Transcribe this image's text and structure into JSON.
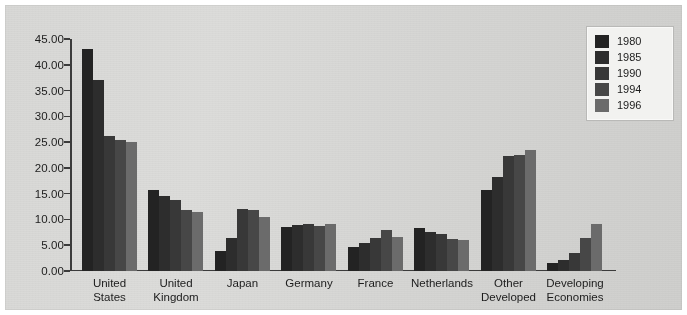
{
  "chart_data": {
    "type": "bar",
    "title": "",
    "subtitle": "",
    "xlabel": "",
    "ylabel": "",
    "ylim": [
      0,
      45
    ],
    "ytick_step": 5,
    "ytick_labels": [
      "0.00",
      "5.00",
      "10.00",
      "15.00",
      "20.00",
      "25.00",
      "30.00",
      "35.00",
      "40.00",
      "45.00"
    ],
    "grid": false,
    "legend_position": "top-right",
    "categories": [
      "United\nStates",
      "United\nKingdom",
      "Japan",
      "Germany",
      "France",
      "Netherlands",
      "Other\nDeveloped",
      "Developing\nEconomies"
    ],
    "series": [
      {
        "name": "1980",
        "color": "#232323",
        "values": [
          43.0,
          15.7,
          3.9,
          8.5,
          4.6,
          8.3,
          15.7,
          1.5
        ]
      },
      {
        "name": "1985",
        "color": "#2d2d2d",
        "values": [
          37.0,
          14.6,
          6.5,
          9.0,
          5.5,
          7.6,
          18.3,
          2.2
        ]
      },
      {
        "name": "1990",
        "color": "#383838",
        "values": [
          26.1,
          13.7,
          12.0,
          9.1,
          6.5,
          7.1,
          22.3,
          3.4
        ]
      },
      {
        "name": "1994",
        "color": "#474747",
        "values": [
          25.5,
          11.8,
          11.8,
          8.7,
          8.0,
          6.3,
          22.5,
          6.5
        ]
      },
      {
        "name": "1996",
        "color": "#6b6b6b",
        "values": [
          25.0,
          11.4,
          10.5,
          9.2,
          6.6,
          6.0,
          23.5,
          9.2
        ]
      }
    ]
  },
  "legend": {
    "items": [
      {
        "label": "1980",
        "color": "#232323"
      },
      {
        "label": "1985",
        "color": "#2d2d2d"
      },
      {
        "label": "1990",
        "color": "#383838"
      },
      {
        "label": "1994",
        "color": "#474747"
      },
      {
        "label": "1996",
        "color": "#6b6b6b"
      }
    ]
  },
  "colors": {
    "background": "#d8d8d6",
    "axis": "#3b3b3b",
    "text": "#1c1c1c",
    "legend_background": "#f2f2f0",
    "legend_border": "#b9b9b7"
  }
}
